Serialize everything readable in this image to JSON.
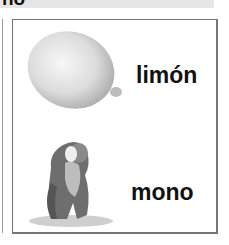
{
  "header": {
    "partial_title": "no"
  },
  "card": {
    "items": [
      {
        "word": "limón",
        "image": "lemon-image"
      },
      {
        "word": "mono",
        "image": "monkey-image"
      }
    ]
  }
}
